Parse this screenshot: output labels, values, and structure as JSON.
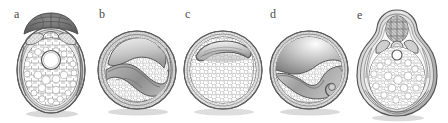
{
  "figure": {
    "type": "scientific-illustration",
    "style": "grayscale line drawing",
    "background_color": "#ffffff",
    "width": 448,
    "height": 123,
    "ink_color": "#555555",
    "shade_dark": "#6f6f6f",
    "shade_mid": "#9a9a9a",
    "shade_light": "#d8d8d8",
    "cell_fill": "#ffffff",
    "shadow_color": "#cfcfcf"
  },
  "panels": [
    {
      "id": "a",
      "label": "a",
      "label_x": 14,
      "label_y": 8,
      "outline_shape": "ovate",
      "description": "Ovate seed with dark apical cap, paired lateral chambers, central circular cavity and dense cellular endosperm",
      "features": [
        "dark apical cap",
        "two small upper chambers",
        "central round cavity",
        "cellular endosperm",
        "layered seed coat"
      ],
      "cx": 51,
      "cy": 70,
      "rx": 34,
      "ry": 43
    },
    {
      "id": "b",
      "label": "b",
      "label_x": 99,
      "label_y": 8,
      "outline_shape": "circular",
      "description": "Circular seed with curved hook-shaped embryo occupying upper half and cellular endosperm below",
      "features": [
        "curved hooked embryo",
        "shaded cotyledon surface",
        "cellular endosperm",
        "double seed coat ring"
      ],
      "cx": 137,
      "cy": 70,
      "rx": 38,
      "ry": 39
    },
    {
      "id": "c",
      "label": "c",
      "label_x": 185,
      "label_y": 8,
      "outline_shape": "circular",
      "description": "Circular seed with small crescent-shaped embryo at top and extensive cellular endosperm",
      "features": [
        "small crescent embryo",
        "large cellular endosperm",
        "thin seed coat"
      ],
      "cx": 223,
      "cy": 70,
      "rx": 38,
      "ry": 39
    },
    {
      "id": "d",
      "label": "d",
      "label_x": 270,
      "label_y": 8,
      "outline_shape": "circular",
      "description": "Circular seed with large shaded embryo cavity above a wavy boundary and a coiled radicle at right",
      "features": [
        "large shaded embryo cavity",
        "wavy tissue boundary",
        "coiled radicle",
        "cellular endosperm"
      ],
      "cx": 309,
      "cy": 70,
      "rx": 38,
      "ry": 39
    },
    {
      "id": "e",
      "label": "e",
      "label_x": 357,
      "label_y": 9,
      "outline_shape": "pyriform",
      "description": "Pear-shaped seed with narrow apical chamber, paired lateral lobes, small round cavity and cellular endosperm",
      "features": [
        "apical chamber",
        "paired lateral lobes",
        "small round cavity",
        "cellular endosperm",
        "multi-layered coat"
      ],
      "cx": 397,
      "cy": 68,
      "rx": 36,
      "ry": 52
    }
  ]
}
